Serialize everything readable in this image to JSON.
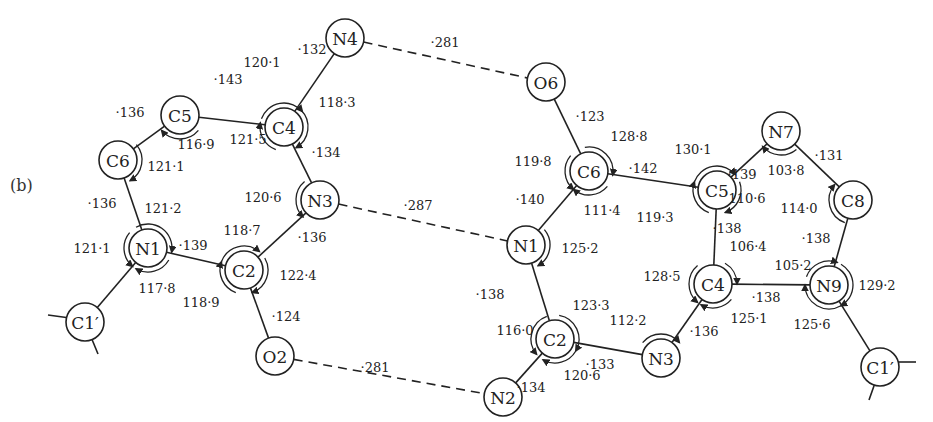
{
  "figure": {
    "panel_label": "(b)"
  },
  "molecules": {
    "left": {
      "atoms": [
        {
          "id": "L_N4",
          "label": "N4",
          "x": 345,
          "y": 38
        },
        {
          "id": "L_C5",
          "label": "C5",
          "x": 180,
          "y": 115
        },
        {
          "id": "L_C4",
          "label": "C4",
          "x": 284,
          "y": 127
        },
        {
          "id": "L_C6",
          "label": "C6",
          "x": 118,
          "y": 160
        },
        {
          "id": "L_N3",
          "label": "N3",
          "x": 320,
          "y": 200
        },
        {
          "id": "L_N1",
          "label": "N1",
          "x": 148,
          "y": 248
        },
        {
          "id": "L_C2",
          "label": "C2",
          "x": 244,
          "y": 270
        },
        {
          "id": "L_C1p",
          "label": "C1′",
          "x": 85,
          "y": 322
        },
        {
          "id": "L_O2",
          "label": "O2",
          "x": 275,
          "y": 356
        }
      ]
    },
    "right": {
      "atoms": [
        {
          "id": "R_O6",
          "label": "O6",
          "x": 546,
          "y": 82
        },
        {
          "id": "R_C6",
          "label": "C6",
          "x": 589,
          "y": 171
        },
        {
          "id": "R_C5",
          "label": "C5",
          "x": 717,
          "y": 190
        },
        {
          "id": "R_N7",
          "label": "N7",
          "x": 781,
          "y": 131
        },
        {
          "id": "R_C8",
          "label": "C8",
          "x": 853,
          "y": 200
        },
        {
          "id": "R_N1",
          "label": "N1",
          "x": 526,
          "y": 245
        },
        {
          "id": "R_C4",
          "label": "C4",
          "x": 713,
          "y": 284
        },
        {
          "id": "R_N9",
          "label": "N9",
          "x": 829,
          "y": 285
        },
        {
          "id": "R_C2",
          "label": "C2",
          "x": 555,
          "y": 339
        },
        {
          "id": "R_N3",
          "label": "N3",
          "x": 661,
          "y": 358
        },
        {
          "id": "R_N2",
          "label": "N2",
          "x": 503,
          "y": 397
        },
        {
          "id": "R_C1p",
          "label": "C1′",
          "x": 880,
          "y": 367
        }
      ]
    }
  },
  "bonds": [
    {
      "from": "L_N4",
      "to": "L_C4",
      "length": "·132",
      "lx": 312,
      "ly": 49
    },
    {
      "from": "L_C5",
      "to": "L_C4",
      "length": "·143",
      "lx": 228,
      "ly": 79
    },
    {
      "from": "L_C5",
      "to": "L_C6",
      "length": "·136",
      "lx": 130,
      "ly": 112
    },
    {
      "from": "L_C4",
      "to": "L_N3",
      "length": "·134",
      "lx": 326,
      "ly": 152
    },
    {
      "from": "L_C6",
      "to": "L_N1",
      "length": "·136",
      "lx": 102,
      "ly": 203
    },
    {
      "from": "L_N1",
      "to": "L_C2",
      "length": "·139",
      "lx": 193,
      "ly": 245
    },
    {
      "from": "L_N3",
      "to": "L_C2",
      "length": "·136",
      "lx": 312,
      "ly": 237
    },
    {
      "from": "L_N1",
      "to": "L_C1p",
      "length": "",
      "lx": 0,
      "ly": 0
    },
    {
      "from": "L_C2",
      "to": "L_O2",
      "length": "·124",
      "lx": 286,
      "ly": 316
    },
    {
      "from": "R_O6",
      "to": "R_C6",
      "length": "·123",
      "lx": 590,
      "ly": 116
    },
    {
      "from": "R_C6",
      "to": "R_C5",
      "length": "·142",
      "lx": 643,
      "ly": 168
    },
    {
      "from": "R_C6",
      "to": "R_N1",
      "length": "·140",
      "lx": 530,
      "ly": 199
    },
    {
      "from": "R_C5",
      "to": "R_N7",
      "length": "·139",
      "lx": 742,
      "ly": 174
    },
    {
      "from": "R_N7",
      "to": "R_C8",
      "length": "·131",
      "lx": 829,
      "ly": 155
    },
    {
      "from": "R_C5",
      "to": "R_C4",
      "length": "·138",
      "lx": 727,
      "ly": 228
    },
    {
      "from": "R_C8",
      "to": "R_N9",
      "length": "·138",
      "lx": 816,
      "ly": 238
    },
    {
      "from": "R_C4",
      "to": "R_N9",
      "length": "·138",
      "lx": 766,
      "ly": 297
    },
    {
      "from": "R_N1",
      "to": "R_C2",
      "length": "·138",
      "lx": 490,
      "ly": 294
    },
    {
      "from": "R_C4",
      "to": "R_N3",
      "length": "·136",
      "lx": 704,
      "ly": 331
    },
    {
      "from": "R_C2",
      "to": "R_N3",
      "length": "·133",
      "lx": 600,
      "ly": 364
    },
    {
      "from": "R_C2",
      "to": "R_N2",
      "length": "·134",
      "lx": 531,
      "ly": 387
    },
    {
      "from": "R_N9",
      "to": "R_C1p",
      "length": "",
      "lx": 0,
      "ly": 0
    }
  ],
  "hydrogen_bonds": [
    {
      "from": "L_N4",
      "to": "R_O6",
      "length": "·281",
      "lx": 445,
      "ly": 42
    },
    {
      "from": "L_N3",
      "to": "R_N1",
      "length": "·287",
      "lx": 418,
      "ly": 205
    },
    {
      "from": "L_O2",
      "to": "R_N2",
      "length": "·281",
      "lx": 375,
      "ly": 367
    }
  ],
  "angles": [
    {
      "atom": "L_C4",
      "value": "120·1",
      "lx": 262,
      "ly": 62,
      "arc_start": 200,
      "arc_end": 320,
      "sweep": 1
    },
    {
      "atom": "L_C4",
      "value": "118·3",
      "lx": 337,
      "ly": 102,
      "arc_start": 315,
      "arc_end": 60,
      "sweep": 1
    },
    {
      "atom": "L_C4",
      "value": "121·5",
      "lx": 248,
      "ly": 139,
      "arc_start": 110,
      "arc_end": 190,
      "sweep": 1
    },
    {
      "atom": "L_C5",
      "value": "116·9",
      "lx": 196,
      "ly": 144,
      "arc_start": 40,
      "arc_end": 140,
      "sweep": 1
    },
    {
      "atom": "L_C6",
      "value": "121·1",
      "lx": 166,
      "ly": 166,
      "arc_start": 320,
      "arc_end": 60,
      "sweep": 1
    },
    {
      "atom": "L_N3",
      "value": "120·6",
      "lx": 263,
      "ly": 197,
      "arc_start": 230,
      "arc_end": 135,
      "sweep": 0
    },
    {
      "atom": "L_N1",
      "value": "121·2",
      "lx": 163,
      "ly": 208,
      "arc_start": 240,
      "arc_end": 10,
      "sweep": 1
    },
    {
      "atom": "L_N1",
      "value": "121·1",
      "lx": 92,
      "ly": 248,
      "arc_start": 220,
      "arc_end": 130,
      "sweep": 0
    },
    {
      "atom": "L_N1",
      "value": "117·8",
      "lx": 157,
      "ly": 288,
      "arc_start": 30,
      "arc_end": 120,
      "sweep": 1
    },
    {
      "atom": "L_C2",
      "value": "118·7",
      "lx": 242,
      "ly": 230,
      "arc_start": 200,
      "arc_end": 310,
      "sweep": 1
    },
    {
      "atom": "L_C2",
      "value": "122·4",
      "lx": 298,
      "ly": 275,
      "arc_start": 330,
      "arc_end": 70,
      "sweep": 1
    },
    {
      "atom": "L_C2",
      "value": "118·9",
      "lx": 201,
      "ly": 302,
      "arc_start": 110,
      "arc_end": 200,
      "sweep": 1
    },
    {
      "atom": "R_C6",
      "value": "128·8",
      "lx": 629,
      "ly": 136,
      "arc_start": 260,
      "arc_end": 10,
      "sweep": 1
    },
    {
      "atom": "R_C6",
      "value": "119·8",
      "lx": 533,
      "ly": 161,
      "arc_start": 220,
      "arc_end": 130,
      "sweep": 0
    },
    {
      "atom": "R_C6",
      "value": "111·4",
      "lx": 602,
      "ly": 210,
      "arc_start": 40,
      "arc_end": 130,
      "sweep": 1
    },
    {
      "atom": "R_C5",
      "value": "130·1",
      "lx": 693,
      "ly": 149,
      "arc_start": 200,
      "arc_end": 320,
      "sweep": 1
    },
    {
      "atom": "R_C5",
      "value": "110·6",
      "lx": 747,
      "ly": 198,
      "arc_start": 340,
      "arc_end": 70,
      "sweep": 1
    },
    {
      "atom": "R_C5",
      "value": "119·3",
      "lx": 655,
      "ly": 217,
      "arc_start": 110,
      "arc_end": 200,
      "sweep": 1
    },
    {
      "atom": "R_N7",
      "value": "103·8",
      "lx": 786,
      "ly": 170,
      "arc_start": 50,
      "arc_end": 140,
      "sweep": 1
    },
    {
      "atom": "R_C8",
      "value": "114·0",
      "lx": 799,
      "ly": 208,
      "arc_start": 110,
      "arc_end": 220,
      "sweep": 1
    },
    {
      "atom": "R_N1",
      "value": "125·2",
      "lx": 580,
      "ly": 248,
      "arc_start": 320,
      "arc_end": 60,
      "sweep": 1
    },
    {
      "atom": "R_C4",
      "value": "106·4",
      "lx": 748,
      "ly": 246,
      "arc_start": 300,
      "arc_end": 360,
      "sweep": 1
    },
    {
      "atom": "R_C4",
      "value": "128·5",
      "lx": 662,
      "ly": 276,
      "arc_start": 230,
      "arc_end": 130,
      "sweep": 0
    },
    {
      "atom": "R_C4",
      "value": "125·1",
      "lx": 749,
      "ly": 318,
      "arc_start": 40,
      "arc_end": 120,
      "sweep": 1
    },
    {
      "atom": "R_N9",
      "value": "105·2",
      "lx": 793,
      "ly": 265,
      "arc_start": 200,
      "arc_end": 290,
      "sweep": 1
    },
    {
      "atom": "R_N9",
      "value": "129·2",
      "lx": 877,
      "ly": 285,
      "arc_start": 300,
      "arc_end": 60,
      "sweep": 1
    },
    {
      "atom": "R_N9",
      "value": "125·6",
      "lx": 812,
      "ly": 324,
      "arc_start": 60,
      "arc_end": 180,
      "sweep": 1
    },
    {
      "atom": "R_C2",
      "value": "123·3",
      "lx": 591,
      "ly": 305,
      "arc_start": 280,
      "arc_end": 30,
      "sweep": 1
    },
    {
      "atom": "R_C2",
      "value": "116·0",
      "lx": 515,
      "ly": 330,
      "arc_start": 250,
      "arc_end": 140,
      "sweep": 0
    },
    {
      "atom": "R_C2",
      "value": "120·6",
      "lx": 582,
      "ly": 375,
      "arc_start": 30,
      "arc_end": 120,
      "sweep": 1
    },
    {
      "atom": "R_N3",
      "value": "112·2",
      "lx": 628,
      "ly": 320,
      "arc_start": 220,
      "arc_end": 320,
      "sweep": 1
    }
  ],
  "substituent_ticks": [
    {
      "atom": "L_C1p",
      "ticks": [
        [
          70,
          318,
          48,
          315
        ],
        [
          91,
          337,
          98,
          354
        ]
      ]
    },
    {
      "atom": "R_C1p",
      "ticks": [
        [
          895,
          362,
          916,
          362
        ],
        [
          875,
          383,
          869,
          400
        ]
      ]
    }
  ]
}
